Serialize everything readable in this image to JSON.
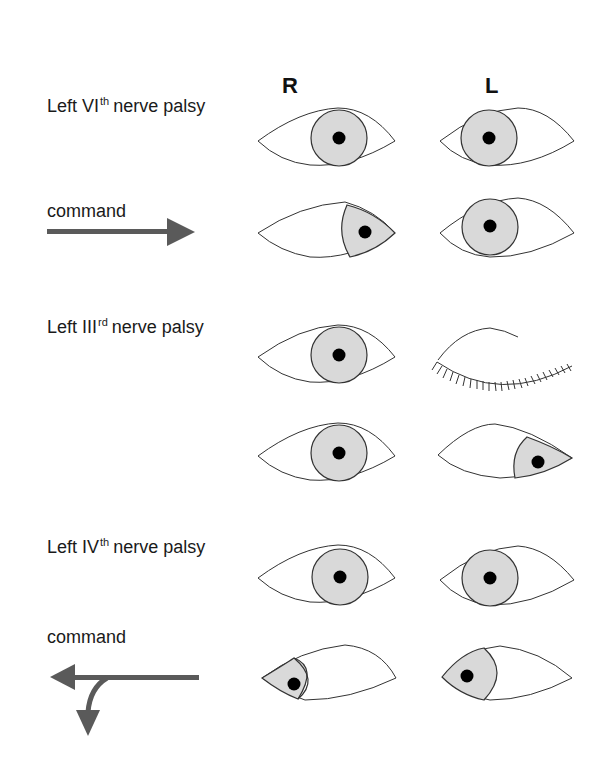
{
  "columns": {
    "right": "R",
    "left": "L"
  },
  "sections": [
    {
      "title_pre": "Left VI",
      "title_sup": "th",
      "title_post": "nerve palsy",
      "command": "command",
      "command_direction": "right"
    },
    {
      "title_pre": "Left III",
      "title_sup": "rd",
      "title_post": "nerve palsy"
    },
    {
      "title_pre": "Left IV",
      "title_sup": "th",
      "title_post": "nerve palsy",
      "command": "command",
      "command_direction": "left-then-down"
    }
  ],
  "colors": {
    "iris": "#d9d9d9",
    "pupil": "#000000",
    "arrow": "#5a5a5a",
    "outline": "#333333"
  }
}
